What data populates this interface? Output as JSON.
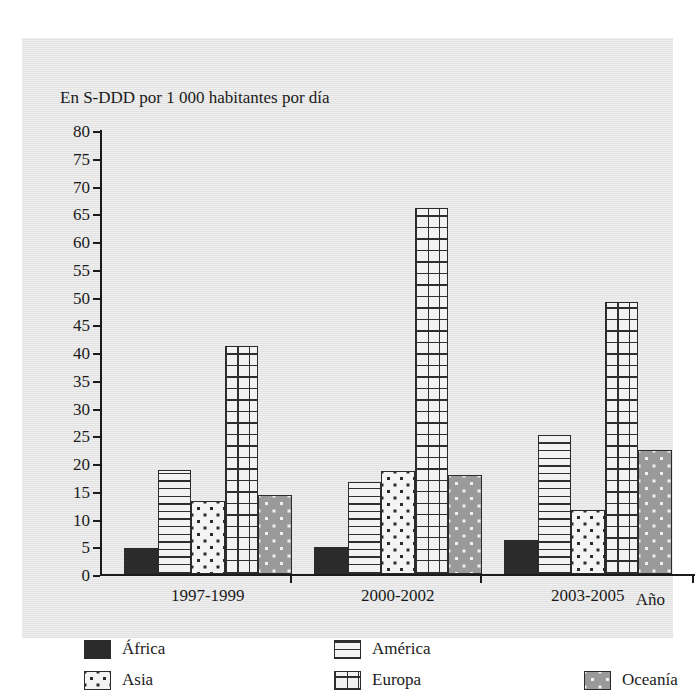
{
  "figure": {
    "title_cropped": "",
    "y_axis_caption": "En S-DDD por 1 000 habitantes por día",
    "x_axis_title": "Año"
  },
  "chart_data": {
    "type": "bar",
    "title": "",
    "xlabel": "Año",
    "ylabel": "En S-DDD por 1 000 habitantes por día",
    "categories": [
      "1997-1999",
      "2000-2002",
      "2003-2005"
    ],
    "ylim": [
      0,
      80
    ],
    "yticks": [
      0,
      5,
      10,
      15,
      20,
      25,
      30,
      35,
      40,
      45,
      50,
      55,
      60,
      65,
      70,
      75,
      80
    ],
    "grid": false,
    "legend_position": "bottom",
    "series": [
      {
        "name": "África",
        "pattern": "solid-black",
        "values": [
          4.7,
          4.9,
          6.1
        ]
      },
      {
        "name": "América",
        "pattern": "horizontal-lines",
        "values": [
          18.7,
          16.5,
          25.0
        ]
      },
      {
        "name": "Asia",
        "pattern": "dots-on-white",
        "values": [
          13.2,
          18.5,
          11.5
        ]
      },
      {
        "name": "Europa",
        "pattern": "grid-crosshatch",
        "values": [
          41.0,
          66.0,
          49.0
        ]
      },
      {
        "name": "Oceanía",
        "pattern": "dots-on-gray",
        "values": [
          14.3,
          17.8,
          22.4
        ]
      }
    ]
  },
  "legend": {
    "items": [
      {
        "label": "África"
      },
      {
        "label": "América"
      },
      {
        "label": "Asia"
      },
      {
        "label": "Europa"
      },
      {
        "label": "Oceanía"
      }
    ]
  },
  "colors": {
    "africa": "#2b2b2b",
    "america": "#f2f2f2",
    "asia": "#f4f4f4",
    "europa": "#f2f2f2",
    "oceania": "#9a9a9a",
    "axis": "#1b1b1b",
    "paper": "#e9e9e9"
  }
}
